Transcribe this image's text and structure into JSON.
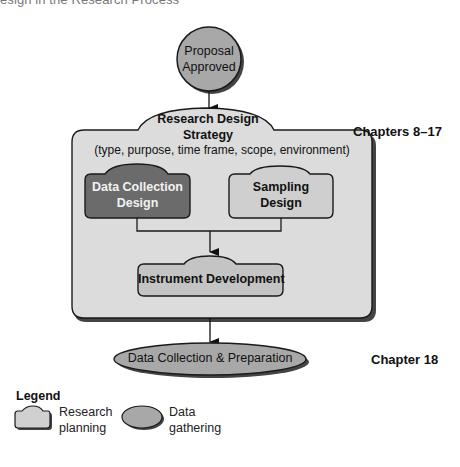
{
  "figure": {
    "caption_partial": "esign in the Research Process"
  },
  "nodes": {
    "proposal": {
      "line1": "Proposal",
      "line2": "Approved"
    },
    "strategy": {
      "title_line1": "Research Design",
      "title_line2": "Strategy",
      "subtitle": "(type, purpose, time frame, scope, environment)"
    },
    "data_collection_design": {
      "line1": "Data Collection",
      "line2": "Design"
    },
    "sampling_design": {
      "line1": "Sampling",
      "line2": "Design"
    },
    "instrument": {
      "label": "Instrument Development"
    },
    "data_prep": {
      "label": "Data Collection & Preparation"
    }
  },
  "side_labels": {
    "chapters_strategy": "Chapters 8–17",
    "chapter_data": "Chapter 18"
  },
  "legend": {
    "title": "Legend",
    "items": [
      {
        "shape": "research-planning-shape",
        "line1": "Research",
        "line2": "planning"
      },
      {
        "shape": "data-gathering-shape",
        "line1": "Data",
        "line2": "gathering"
      }
    ]
  },
  "colors": {
    "node_fill": "#a9a9a9",
    "container_fill": "#dcdcdc",
    "light_box_fill": "#cfcfcf",
    "dark_box_fill": "#6b6b6b",
    "stroke": "#1a1a1a",
    "shadow": "#555555"
  }
}
